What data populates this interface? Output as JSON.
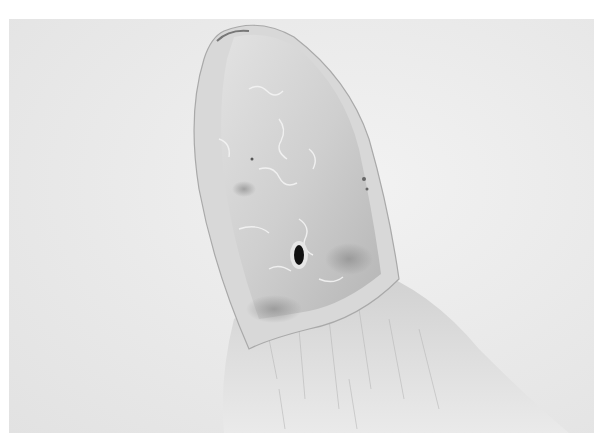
{
  "image": {
    "subject": "close-up of a bird's beak with nostril, feathered head base",
    "style": "grayscale photograph",
    "colors": {
      "frame": "#ffffff",
      "background": "#e8e8e8",
      "beak_light": "#dcdcdc",
      "beak_mid": "#c4c4c4",
      "beak_shadow": "#9a9a9a",
      "feathers": "#e4e4e4",
      "nostril": "#111111"
    }
  }
}
